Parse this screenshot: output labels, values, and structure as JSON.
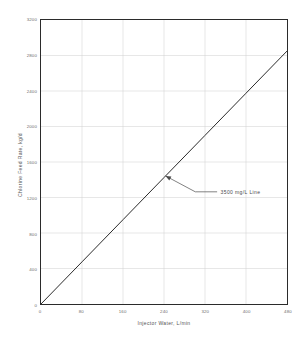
{
  "chart_data": {
    "type": "line",
    "title": "",
    "xlabel": "Injector Water, L/min",
    "ylabel": "Chlorine Feed Rate, kg/d",
    "xlim": [
      0,
      480
    ],
    "ylim": [
      0,
      3200
    ],
    "xticks": [
      0,
      80,
      160,
      240,
      320,
      400,
      480
    ],
    "yticks": [
      0,
      400,
      800,
      1200,
      1600,
      2000,
      2400,
      2800,
      3200
    ],
    "xtick_labels": [
      "0",
      "80",
      "160",
      "240",
      "320",
      "400",
      "480"
    ],
    "ytick_labels": [
      "0",
      "400",
      "800",
      "1200",
      "1600",
      "2000",
      "2400",
      "2800",
      "3200"
    ],
    "grid": true,
    "legend": null,
    "series": [
      {
        "name": "3500 mg/L Line",
        "color": "#2b2b2b",
        "x": [
          0,
          80,
          160,
          240,
          320,
          400,
          480
        ],
        "y": [
          0,
          475,
          950,
          1425,
          1900,
          2375,
          2850
        ]
      }
    ],
    "annotations": [
      {
        "text": "3500 mg/L Line",
        "x": 243,
        "y": 1443
      }
    ]
  },
  "axes": {
    "x_title": "Injector Water, L/min",
    "y_title": "Chlorine Feed Rate, kg/d"
  },
  "annotation": {
    "label": "3500 mg/L Line"
  },
  "colors": {
    "line": "#2b2b2b",
    "grid": "#cfcfcf",
    "frame": "#2b2b2b",
    "tick_text": "#6d6d6d",
    "axis_title": "#555555",
    "background": "#ffffff"
  }
}
